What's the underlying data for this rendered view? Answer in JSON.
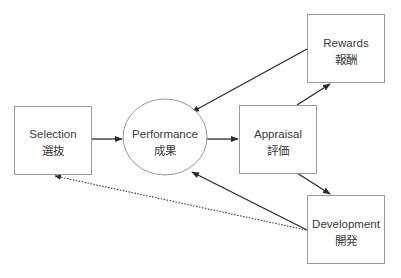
{
  "diagram": {
    "nodes": [
      {
        "id": "selection",
        "shape": "box",
        "label": "Selection",
        "label_jp": "選抜"
      },
      {
        "id": "performance",
        "shape": "ellipse",
        "label": "Performance",
        "label_jp": "成果"
      },
      {
        "id": "appraisal",
        "shape": "box",
        "label": "Appraisal",
        "label_jp": "評価"
      },
      {
        "id": "rewards",
        "shape": "box",
        "label": "Rewards",
        "label_jp": "報酬"
      },
      {
        "id": "development",
        "shape": "box",
        "label": "Development",
        "label_jp": "開発"
      }
    ],
    "edges": [
      {
        "from": "selection",
        "to": "performance",
        "style": "solid"
      },
      {
        "from": "performance",
        "to": "appraisal",
        "style": "solid"
      },
      {
        "from": "appraisal",
        "to": "rewards",
        "style": "solid"
      },
      {
        "from": "appraisal",
        "to": "development",
        "style": "solid"
      },
      {
        "from": "rewards",
        "to": "performance",
        "style": "solid"
      },
      {
        "from": "development",
        "to": "performance",
        "style": "solid"
      },
      {
        "from": "development",
        "to": "selection",
        "style": "dotted"
      }
    ]
  }
}
